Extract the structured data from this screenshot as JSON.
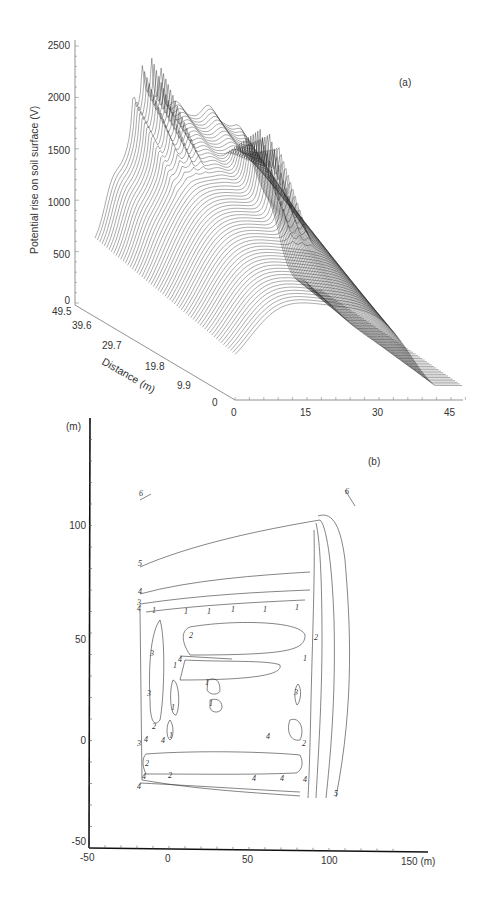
{
  "chart_data": [
    {
      "type": "surface",
      "panel_label": "(a)",
      "title": "",
      "zlabel": "Potential rise on soil surface (V)",
      "ylabel": "Distance (m)",
      "xlabel": "",
      "z_ticks": [
        "0",
        "500",
        "1000",
        "1500",
        "2000",
        "2500"
      ],
      "zlim": [
        0,
        2500
      ],
      "y_ticks": [
        "49.5",
        "39.6",
        "29.7",
        "19.8",
        "9.9",
        "0"
      ],
      "ylim": [
        0,
        49.5
      ],
      "x_ticks": [
        "0",
        "15",
        "30",
        "45"
      ],
      "xlim": [
        0,
        47
      ],
      "grid": false,
      "description": "Wireframe surface of soil surface potential rise; plateau ~1500-1800 V with sharp peaks near electrodes, decaying to ~700 V at near edge and ~200 V at far x edge",
      "approx_peak_values_V": [
        1750,
        1800,
        1750,
        1700,
        1250,
        1200,
        1150
      ]
    },
    {
      "type": "contour",
      "panel_label": "(b)",
      "xlabel": "(m)",
      "ylabel": "(m)",
      "x_ticks": [
        "-50",
        "0",
        "50",
        "100",
        "150 (m)"
      ],
      "y_ticks": [
        "-50",
        "0",
        "50",
        "100"
      ],
      "xlim": [
        -50,
        150
      ],
      "ylim": [
        -50,
        130
      ],
      "contour_levels": [
        "1",
        "2",
        "3",
        "4",
        "5",
        "6"
      ],
      "grid": false
    }
  ],
  "panel_a": {
    "label": "(a)",
    "z_axis_title": "Potential rise on soil surface (V)",
    "z_ticks": [
      {
        "label": "2500",
        "y": 46
      },
      {
        "label": "2000",
        "y": 98
      },
      {
        "label": "1500",
        "y": 151
      },
      {
        "label": "1000",
        "y": 203
      },
      {
        "label": "500",
        "y": 255
      },
      {
        "label": "0",
        "y": 303
      }
    ],
    "depth_axis_title": "Distance (m)",
    "depth_ticks": [
      "49.5",
      "39.6",
      "29.7",
      "19.8",
      "9.9",
      "0"
    ],
    "x_ticks": [
      "0",
      "15",
      "30",
      "45"
    ]
  },
  "panel_b": {
    "label": "(b)",
    "y_unit": "(m)",
    "y_ticks": [
      "100",
      "50",
      "0",
      "-50"
    ],
    "x_ticks": [
      "-50",
      "0",
      "50",
      "100",
      "150 (m)"
    ],
    "contour_labels": [
      {
        "t": "6",
        "x": 141,
        "y": 495
      },
      {
        "t": "6",
        "x": 347,
        "y": 493
      },
      {
        "t": "5",
        "x": 140,
        "y": 565
      },
      {
        "t": "4",
        "x": 140,
        "y": 593
      },
      {
        "t": "3",
        "x": 139,
        "y": 604
      },
      {
        "t": "4",
        "x": 139,
        "y": 610
      },
      {
        "t": "1",
        "x": 154,
        "y": 612
      },
      {
        "t": "1",
        "x": 186,
        "y": 613
      },
      {
        "t": "1",
        "x": 209,
        "y": 613
      },
      {
        "t": "1",
        "x": 233,
        "y": 611
      },
      {
        "t": "1",
        "x": 265,
        "y": 611
      },
      {
        "t": "1",
        "x": 297,
        "y": 609
      },
      {
        "t": "2",
        "x": 191,
        "y": 637
      },
      {
        "t": "2",
        "x": 316,
        "y": 639
      },
      {
        "t": "3",
        "x": 152,
        "y": 655
      },
      {
        "t": "4",
        "x": 180,
        "y": 661
      },
      {
        "t": "1",
        "x": 175,
        "y": 667
      },
      {
        "t": "1",
        "x": 305,
        "y": 660
      },
      {
        "t": "1",
        "x": 207,
        "y": 684
      },
      {
        "t": "1",
        "x": 211,
        "y": 705
      },
      {
        "t": "3",
        "x": 149,
        "y": 695
      },
      {
        "t": "1",
        "x": 173,
        "y": 709
      },
      {
        "t": "3",
        "x": 296,
        "y": 694
      },
      {
        "t": "2",
        "x": 154,
        "y": 728
      },
      {
        "t": "1",
        "x": 171,
        "y": 737
      },
      {
        "t": "3",
        "x": 139,
        "y": 745
      },
      {
        "t": "4",
        "x": 146,
        "y": 741
      },
      {
        "t": "4",
        "x": 163,
        "y": 742
      },
      {
        "t": "4",
        "x": 268,
        "y": 738
      },
      {
        "t": "2",
        "x": 304,
        "y": 745
      },
      {
        "t": "2",
        "x": 147,
        "y": 765
      },
      {
        "t": "4",
        "x": 144,
        "y": 778
      },
      {
        "t": "2",
        "x": 170,
        "y": 777
      },
      {
        "t": "4",
        "x": 254,
        "y": 780
      },
      {
        "t": "4",
        "x": 282,
        "y": 780
      },
      {
        "t": "4",
        "x": 305,
        "y": 781
      },
      {
        "t": "4",
        "x": 139,
        "y": 788
      },
      {
        "t": "5",
        "x": 336,
        "y": 795
      }
    ]
  }
}
